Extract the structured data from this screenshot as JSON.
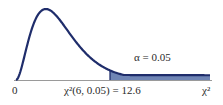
{
  "chart_data": {
    "type": "area",
    "title": "",
    "distribution": "chi-square",
    "degrees_of_freedom": 6,
    "alpha": 0.05,
    "critical_value": 12.6,
    "xlabel": "χ²",
    "ylabel": "",
    "x_tick_labels": [
      "0",
      "χ²(6, 0.05) = 12.6",
      "χ²"
    ],
    "xlim": [
      0,
      26
    ],
    "shaded_region": {
      "from": 12.6,
      "to": 26,
      "label": "α = 0.05"
    },
    "grid": false,
    "legend": "none",
    "colors": {
      "curve": "#1f2d6b",
      "fill": "#6f85b5",
      "axis": "#9a9a9a"
    }
  },
  "labels": {
    "origin": "0",
    "critical": "χ²(6, 0.05) = 12.6",
    "axis_end": "χ²",
    "alpha": "α = 0.05"
  }
}
